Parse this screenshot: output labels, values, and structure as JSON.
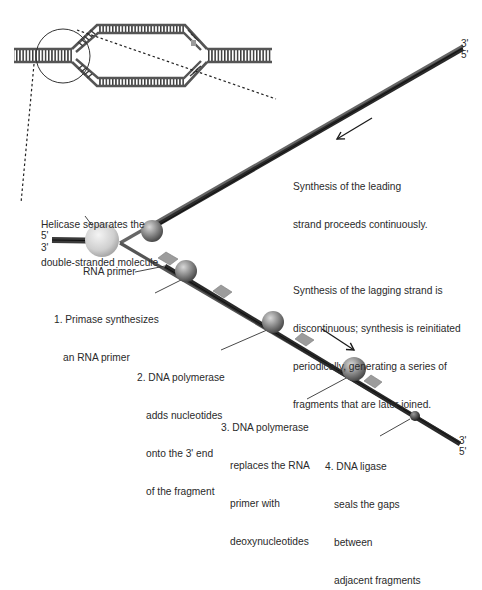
{
  "diagram": {
    "colors": {
      "strand_dark": "#2b2b2b",
      "strand_mid": "#555555",
      "helicase": "#d6d6d6",
      "polymerase": "#8c8c8c",
      "primer": "#9a9a9a",
      "text": "#2a2a2a",
      "background": "#ffffff"
    },
    "ends": {
      "incoming_top": "5'",
      "incoming_bottom": "3'",
      "leading_top": "3'",
      "leading_bottom": "5'",
      "lagging_top": "3'",
      "lagging_bottom": "5'"
    },
    "labels": {
      "leading_note": [
        "Synthesis of the leading",
        "strand proceeds continuously."
      ],
      "helicase": [
        "Helicase separates the",
        "double-stranded molecule"
      ],
      "rna_primer": "RNA primer",
      "primase": [
        "1. Primase synthesizes",
        "an RNA primer"
      ],
      "lagging_note": [
        "Synthesis of the lagging strand is",
        "discontinuous; synthesis is reinitiated",
        "periodically, generating a series of",
        "fragments that are later joined."
      ],
      "polymerase_add": [
        "2. DNA polymerase",
        "adds nucleotides",
        "onto the 3' end",
        "of the fragment"
      ],
      "polymerase_replace": [
        "3. DNA polymerase",
        "replaces the RNA",
        "primer with",
        "deoxynucleotides"
      ],
      "ligase": [
        "4. DNA ligase",
        "seals the gaps",
        "between",
        "adjacent fragments"
      ]
    },
    "components": [
      {
        "name": "helicase",
        "icon": "sphere-light"
      },
      {
        "name": "leading-polymerase",
        "icon": "sphere-dark"
      },
      {
        "name": "primase",
        "icon": "sphere-dark"
      },
      {
        "name": "lagging-polymerase-1",
        "icon": "sphere-dark"
      },
      {
        "name": "lagging-polymerase-2",
        "icon": "sphere-dark"
      },
      {
        "name": "ligase",
        "icon": "sphere-small-dark"
      }
    ]
  }
}
